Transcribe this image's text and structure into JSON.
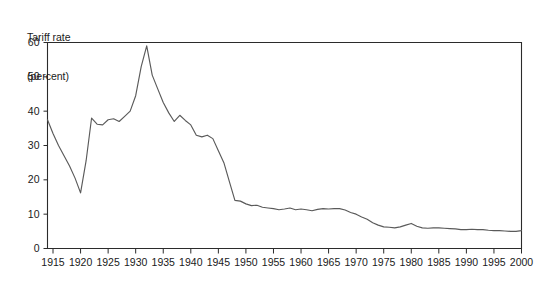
{
  "chart_data": {
    "type": "line",
    "title": "",
    "ylabel_lines": [
      "Tariff rate",
      "(percent)"
    ],
    "xlabel": "",
    "ylabel": "Tariff rate (percent)",
    "grid": false,
    "legend": "none",
    "xlim": [
      1914,
      2000
    ],
    "ylim": [
      0,
      60
    ],
    "yticks": [
      0,
      10,
      20,
      30,
      40,
      50,
      60
    ],
    "ytick_labels": [
      "0",
      "10",
      "20",
      "30",
      "40",
      "50",
      "60"
    ],
    "xticks": [
      1915,
      1920,
      1925,
      1930,
      1935,
      1940,
      1945,
      1950,
      1955,
      1960,
      1965,
      1970,
      1975,
      1980,
      1985,
      1990,
      1995,
      2000
    ],
    "xtick_labels": [
      "1915",
      "1920",
      "1925",
      "1930",
      "1935",
      "1940",
      "1945",
      "1950",
      "1955",
      "1960",
      "1965",
      "1970",
      "1975",
      "1980",
      "1985",
      "1990",
      "1995",
      "2000"
    ],
    "series": [
      {
        "name": "Tariff rate",
        "color": "#5a5a5a",
        "x": [
          1914,
          1915,
          1916,
          1917,
          1918,
          1919,
          1920,
          1921,
          1922,
          1923,
          1924,
          1925,
          1926,
          1927,
          1928,
          1929,
          1930,
          1931,
          1932,
          1933,
          1934,
          1935,
          1936,
          1937,
          1938,
          1939,
          1940,
          1941,
          1942,
          1943,
          1944,
          1945,
          1946,
          1947,
          1948,
          1949,
          1950,
          1951,
          1952,
          1953,
          1954,
          1955,
          1956,
          1957,
          1958,
          1959,
          1960,
          1961,
          1962,
          1963,
          1964,
          1965,
          1966,
          1967,
          1968,
          1969,
          1970,
          1971,
          1972,
          1973,
          1974,
          1975,
          1976,
          1977,
          1978,
          1979,
          1980,
          1981,
          1982,
          1983,
          1984,
          1985,
          1986,
          1987,
          1988,
          1989,
          1990,
          1991,
          1992,
          1993,
          1994,
          1995,
          1996,
          1997,
          1998,
          1999,
          2000
        ],
        "y": [
          37.5,
          33.5,
          30.0,
          27.0,
          24.0,
          20.5,
          16.2,
          25.5,
          38.0,
          36.2,
          36.0,
          37.5,
          37.8,
          37.0,
          38.5,
          40.0,
          44.5,
          53.0,
          59.0,
          50.5,
          46.5,
          42.5,
          39.5,
          37.0,
          38.8,
          37.3,
          36.0,
          33.0,
          32.5,
          33.0,
          32.0,
          28.5,
          25.0,
          19.5,
          14.0,
          13.8,
          13.0,
          12.5,
          12.6,
          12.0,
          11.8,
          11.6,
          11.3,
          11.5,
          11.8,
          11.3,
          11.5,
          11.3,
          11.0,
          11.4,
          11.6,
          11.5,
          11.6,
          11.6,
          11.2,
          10.5,
          10.0,
          9.2,
          8.5,
          7.5,
          6.8,
          6.3,
          6.2,
          6.0,
          6.3,
          6.8,
          7.3,
          6.5,
          6.0,
          5.9,
          6.0,
          6.0,
          5.9,
          5.8,
          5.7,
          5.5,
          5.5,
          5.6,
          5.5,
          5.5,
          5.3,
          5.2,
          5.2,
          5.1,
          5.0,
          5.0,
          5.2
        ]
      }
    ]
  }
}
